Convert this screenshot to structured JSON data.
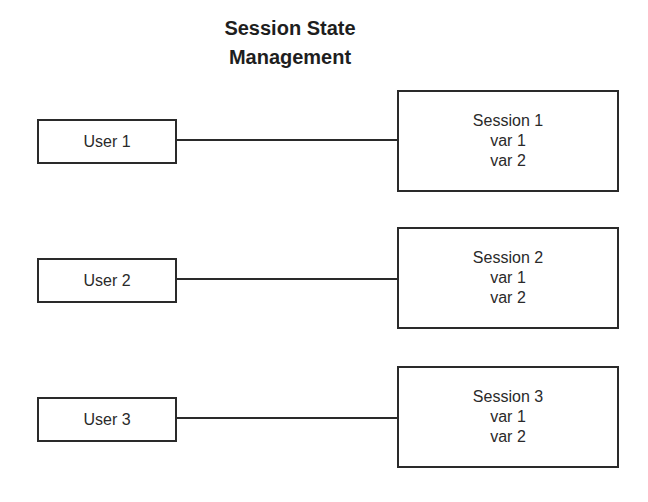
{
  "diagram": {
    "title_line1": "Session State",
    "title_line2": "Management",
    "rows": [
      {
        "user": "User 1",
        "session": {
          "name": "Session 1",
          "vars": [
            "var 1",
            "var 2"
          ]
        }
      },
      {
        "user": "User 2",
        "session": {
          "name": "Session 2",
          "vars": [
            "var 1",
            "var 2"
          ]
        }
      },
      {
        "user": "User 3",
        "session": {
          "name": "Session 3",
          "vars": [
            "var 1",
            "var 2"
          ]
        }
      }
    ],
    "colors": {
      "stroke": "#2a2a2a",
      "background": "#ffffff",
      "text": "#222222"
    }
  }
}
